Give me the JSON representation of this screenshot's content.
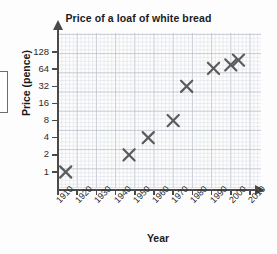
{
  "chart_data": {
    "type": "scatter",
    "title": "Price of a loaf of white bread",
    "xlabel": "Year",
    "ylabel": "Price (pence)",
    "xlim": [
      1910,
      2010
    ],
    "ylim": [
      1,
      128
    ],
    "yscale": "log2",
    "grid": true,
    "legend": "none",
    "x_ticks": [
      "1910",
      "1920",
      "1930",
      "1940",
      "1950",
      "1960",
      "1970",
      "1980",
      "1990",
      "2000",
      "2010"
    ],
    "y_ticks": [
      "1",
      "2",
      "4",
      "8",
      "16",
      "32",
      "64",
      "128"
    ],
    "marker_symbol": "x-cross",
    "marker_color": "#5b5b5b",
    "points": [
      {
        "x": 1914,
        "y": 1
      },
      {
        "x": 1947,
        "y": 2
      },
      {
        "x": 1957,
        "y": 4
      },
      {
        "x": 1970,
        "y": 8
      },
      {
        "x": 1977,
        "y": 32
      },
      {
        "x": 1991,
        "y": 66
      },
      {
        "x": 2000,
        "y": 76
      },
      {
        "x": 2004,
        "y": 92
      }
    ]
  },
  "axes": {
    "y_label": "Price (pence)",
    "x_label": "Year"
  },
  "title": "Price of a loaf of white bread",
  "colors": {
    "grid_minor": "#d8dce4",
    "grid_major": "#b9bfc9",
    "axis": "#4a4a4a",
    "marker": "#5b5b5b",
    "text": "#1b1b1b",
    "background": "#fdfdfd"
  }
}
